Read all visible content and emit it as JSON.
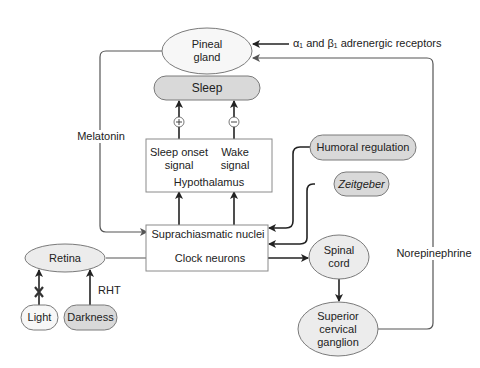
{
  "diagram": {
    "nodes": {
      "pineal": {
        "line1": "Pineal",
        "line2": "gland"
      },
      "sleep": {
        "label": "Sleep"
      },
      "hypothalamus": {
        "sleep_onset_line1": "Sleep onset",
        "sleep_onset_line2": "signal",
        "wake_line1": "Wake",
        "wake_line2": "signal",
        "title": "Hypothalamus"
      },
      "scn": {
        "line1": "Suprachiasmatic nuclei",
        "line2": "Clock neurons"
      },
      "humoral": {
        "label": "Humoral regulation"
      },
      "zeitgeber": {
        "label": "Zeitgeber"
      },
      "retina": {
        "label": "Retina"
      },
      "light": {
        "label": "Light"
      },
      "darkness": {
        "label": "Darkness"
      },
      "spinal": {
        "line1": "Spinal",
        "line2": "cord"
      },
      "scg": {
        "line1": "Superior",
        "line2": "cervical",
        "line3": "ganglion"
      }
    },
    "edge_labels": {
      "melatonin": "Melatonin",
      "receptors": "α₁ and β₁ adrenergic receptors",
      "norepinephrine": "Norepinephrine",
      "rht": "RHT",
      "plus": "+",
      "minus": "−"
    },
    "colors": {
      "fill_gray": "#d9d9d9",
      "fill_ellipse": "#ececec",
      "stroke": "#7a7a7a",
      "arrow": "#222222"
    }
  }
}
